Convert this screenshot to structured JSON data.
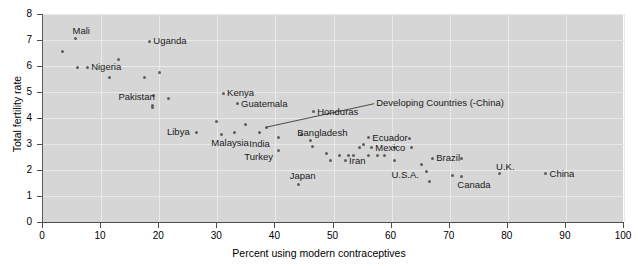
{
  "chart_data": {
    "type": "scatter",
    "title": "",
    "xlabel": "Percent using modern contraceptives",
    "ylabel": "Total fertility rate",
    "xlim": [
      0,
      100
    ],
    "ylim": [
      0,
      8
    ],
    "xticks": [
      0,
      10,
      20,
      30,
      40,
      50,
      60,
      70,
      80,
      90,
      100
    ],
    "yticks": [
      0,
      1,
      2,
      3,
      4,
      5,
      6,
      7,
      8
    ],
    "grid": true,
    "legend": "none",
    "marker_color": "#5e5e5e",
    "panel_color": "#d6d6d6",
    "annotations": [
      {
        "text": "Developing Countries (-China)",
        "label_x": 57.0,
        "label_y": 4.55,
        "point_x": 38.5,
        "point_y": 3.65
      }
    ],
    "labeled_points": [
      {
        "name": "Mali",
        "x": 5.6,
        "y": 7.05,
        "label_dx": -2,
        "label_dy": -13
      },
      {
        "name": "Uganda",
        "x": 18.3,
        "y": 6.95,
        "label_dx": 5,
        "label_dy": -5
      },
      {
        "name": "Nigeria",
        "x": 7.6,
        "y": 5.95,
        "label_dx": 5,
        "label_dy": -5
      },
      {
        "name": "Pakistan",
        "x": 19.0,
        "y": 4.85,
        "label_dx": -34,
        "label_dy": -4
      },
      {
        "name": "Kenya",
        "x": 31.0,
        "y": 4.95,
        "label_dx": 5,
        "label_dy": -5
      },
      {
        "name": "Guatemala",
        "x": 33.4,
        "y": 4.55,
        "label_dx": 5,
        "label_dy": -5
      },
      {
        "name": "Honduras",
        "x": 46.5,
        "y": 4.25,
        "label_dx": 5,
        "label_dy": -5
      },
      {
        "name": "Libya",
        "x": 26.5,
        "y": 3.45,
        "label_dx": -29,
        "label_dy": -5
      },
      {
        "name": "Malaysia",
        "x": 30.7,
        "y": 3.35,
        "label_dx": -9,
        "label_dy": 3
      },
      {
        "name": "India",
        "x": 40.5,
        "y": 3.25,
        "label_dx": -28,
        "label_dy": 1
      },
      {
        "name": "Turkey",
        "x": 40.5,
        "y": 2.75,
        "label_dx": -33,
        "label_dy": 1
      },
      {
        "name": "Japan",
        "x": 44.0,
        "y": 1.45,
        "label_dx": -8,
        "label_dy": -13
      },
      {
        "name": "Bangladesh",
        "x": 46.0,
        "y": 3.15,
        "label_dx": -12,
        "label_dy": -12
      },
      {
        "name": "Ecuador",
        "x": 56.0,
        "y": 3.25,
        "label_dx": 5,
        "label_dy": -5
      },
      {
        "name": "Mexico",
        "x": 56.5,
        "y": 2.85,
        "label_dx": 5,
        "label_dy": -5
      },
      {
        "name": "Iran",
        "x": 52.0,
        "y": 2.35,
        "label_dx": 5,
        "label_dy": -5
      },
      {
        "name": "Brazil",
        "x": 67.0,
        "y": 2.45,
        "label_dx": 5,
        "label_dy": -5
      },
      {
        "name": "U.S.A.",
        "x": 66.0,
        "y": 1.95,
        "label_dx": -34,
        "label_dy": -1
      },
      {
        "name": "Canada",
        "x": 72.0,
        "y": 1.75,
        "label_dx": -3,
        "label_dy": 3
      },
      {
        "name": "U.K.",
        "x": 78.5,
        "y": 1.85,
        "label_dx": -2,
        "label_dy": -12
      },
      {
        "name": "China",
        "x": 86.5,
        "y": 1.85,
        "label_dx": 5,
        "label_dy": -5
      }
    ],
    "unlabeled_points": [
      {
        "x": 3.4,
        "y": 6.55
      },
      {
        "x": 6.0,
        "y": 5.95
      },
      {
        "x": 11.5,
        "y": 5.55
      },
      {
        "x": 13.0,
        "y": 6.25
      },
      {
        "x": 17.5,
        "y": 5.55
      },
      {
        "x": 20.0,
        "y": 5.75
      },
      {
        "x": 18.9,
        "y": 4.5
      },
      {
        "x": 18.9,
        "y": 4.4
      },
      {
        "x": 21.6,
        "y": 4.75
      },
      {
        "x": 29.8,
        "y": 3.85
      },
      {
        "x": 33.0,
        "y": 3.45
      },
      {
        "x": 34.8,
        "y": 3.75
      },
      {
        "x": 37.2,
        "y": 3.45
      },
      {
        "x": 38.5,
        "y": 3.65
      },
      {
        "x": 44.5,
        "y": 3.35
      },
      {
        "x": 46.3,
        "y": 2.9
      },
      {
        "x": 48.8,
        "y": 2.65
      },
      {
        "x": 49.5,
        "y": 2.35
      },
      {
        "x": 51.0,
        "y": 2.55
      },
      {
        "x": 52.5,
        "y": 2.55
      },
      {
        "x": 53.5,
        "y": 2.55
      },
      {
        "x": 54.5,
        "y": 2.85
      },
      {
        "x": 55.2,
        "y": 3.0
      },
      {
        "x": 56.0,
        "y": 2.55
      },
      {
        "x": 57.5,
        "y": 2.55
      },
      {
        "x": 58.8,
        "y": 2.55
      },
      {
        "x": 60.5,
        "y": 2.85
      },
      {
        "x": 60.5,
        "y": 2.35
      },
      {
        "x": 63.0,
        "y": 3.2
      },
      {
        "x": 63.5,
        "y": 2.85
      },
      {
        "x": 65.2,
        "y": 2.2
      },
      {
        "x": 66.5,
        "y": 1.55
      },
      {
        "x": 70.5,
        "y": 1.8
      },
      {
        "x": 72.0,
        "y": 2.45
      }
    ]
  }
}
